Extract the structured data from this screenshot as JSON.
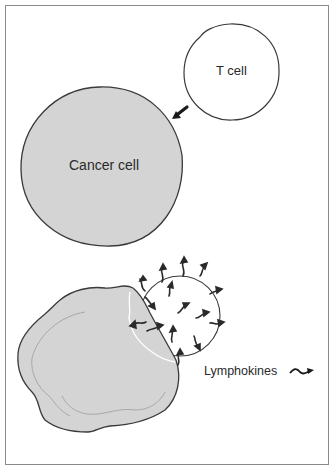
{
  "figure": {
    "labels": {
      "t_cell": "T cell",
      "cancer_cell": "Cancer cell",
      "lymphokines": "Lymphokines"
    },
    "colors": {
      "cell_fill_cancer": "#d4d4d4",
      "cell_fill_tcell": "#ffffff",
      "outline": "#3a3a3a",
      "frame": "#8a8a8a",
      "arrow": "#1a1a1a",
      "lymphokine": "#2a2a2a"
    },
    "panels": [
      {
        "name": "approach",
        "description": "T cell approaching cancer cell, arrow indicates direction of movement"
      },
      {
        "name": "attack",
        "description": "T cell bound to cancer cell releasing lymphokines"
      }
    ]
  }
}
